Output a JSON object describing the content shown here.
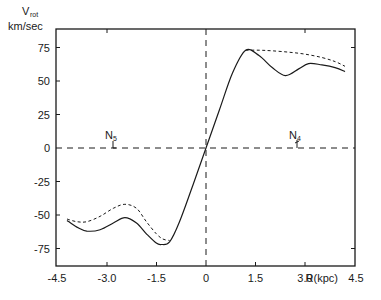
{
  "chart_data": {
    "type": "line",
    "title": "",
    "xlabel": "R(kpc)",
    "ylabel": "V_rot km/sec",
    "ylabel_main": "V",
    "ylabel_sub": "rot",
    "ylabel_unit": "km/sec",
    "xlim": [
      -4.5,
      4.5
    ],
    "ylim": [
      -88,
      88
    ],
    "x_ticks": [
      -4.5,
      -3.0,
      -1.5,
      0,
      1.5,
      3.0,
      4.5
    ],
    "x_tick_labels": [
      "-4.5",
      "-3.0",
      "-1.5",
      "0",
      "1.5",
      "3.0",
      "4.5"
    ],
    "y_ticks": [
      75,
      50,
      25,
      0,
      -25,
      -50,
      -75
    ],
    "y_tick_labels": [
      "75",
      "50",
      "25",
      "0",
      "-25",
      "-50",
      "-75"
    ],
    "grid": false,
    "reference_lines": [
      {
        "orientation": "horizontal",
        "value": 0,
        "style": "dashed"
      },
      {
        "orientation": "vertical",
        "value": 0,
        "style": "dashed"
      }
    ],
    "annotations": [
      {
        "label": "N",
        "subscript": "5",
        "x": -2.8,
        "y": 0
      },
      {
        "label": "N",
        "subscript": "4",
        "x": 2.7,
        "y": 0
      }
    ],
    "series": [
      {
        "name": "solid curve",
        "style": "solid",
        "x": [
          -4.2,
          -3.9,
          -3.6,
          -3.2,
          -2.8,
          -2.45,
          -2.1,
          -1.8,
          -1.5,
          -1.35,
          -1.1,
          -0.8,
          -0.4,
          0,
          0.4,
          0.8,
          1.2,
          1.6,
          2.0,
          2.4,
          2.8,
          3.1,
          3.5,
          3.9,
          4.2
        ],
        "y": [
          -54,
          -59,
          -62,
          -61,
          -56,
          -52,
          -56,
          -64,
          -71,
          -72,
          -70,
          -55,
          -28,
          0,
          28,
          56,
          73,
          69,
          60,
          54,
          59,
          63,
          62,
          60,
          57
        ]
      },
      {
        "name": "dashed curve",
        "style": "dashed",
        "x": [
          -4.2,
          -3.9,
          -3.6,
          -3.2,
          -2.8,
          -2.45,
          -2.1,
          -1.8,
          -1.5,
          -1.3,
          -1.1
        ],
        "y": [
          -53,
          -55,
          -55,
          -51,
          -45,
          -42,
          -45,
          -55,
          -64,
          -68,
          -69
        ],
        "x_right": [
          1.2,
          1.6,
          2.0,
          2.5,
          3.0,
          3.5,
          3.9,
          4.2
        ],
        "y_right": [
          73,
          73,
          72.5,
          71.5,
          70,
          67.5,
          64.5,
          61
        ]
      }
    ]
  }
}
